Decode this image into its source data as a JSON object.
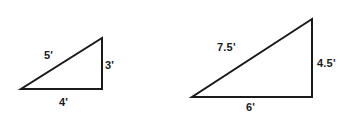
{
  "figure": {
    "background_color": "#ffffff",
    "stroke_color": "#1a1a1a",
    "text_color": "#1a1a1a",
    "stroke_width": 2
  },
  "chart_data": {
    "type": "diagram",
    "shapes": [
      {
        "name": "small-triangle",
        "kind": "right-triangle",
        "vertices": [
          [
            21,
            89
          ],
          [
            102,
            89
          ],
          [
            102,
            38
          ]
        ],
        "sides": [
          {
            "name": "hypotenuse",
            "label": "5'",
            "value": 5,
            "unit": "feet"
          },
          {
            "name": "vertical-leg",
            "label": "3'",
            "value": 3,
            "unit": "feet"
          },
          {
            "name": "base-leg",
            "label": "4'",
            "value": 4,
            "unit": "feet"
          }
        ]
      },
      {
        "name": "large-triangle",
        "kind": "right-triangle",
        "vertices": [
          [
            192,
            97
          ],
          [
            312,
            97
          ],
          [
            312,
            19
          ]
        ],
        "sides": [
          {
            "name": "hypotenuse",
            "label": "7.5'",
            "value": 7.5,
            "unit": "feet"
          },
          {
            "name": "vertical-leg",
            "label": "4.5'",
            "value": 4.5,
            "unit": "feet"
          },
          {
            "name": "base-leg",
            "label": "6'",
            "value": 6,
            "unit": "feet"
          }
        ]
      }
    ]
  },
  "labels": {
    "small": {
      "hypotenuse": "5'",
      "vertical": "3'",
      "base": "4'"
    },
    "large": {
      "hypotenuse": "7.5'",
      "vertical": "4.5'",
      "base": "6'"
    }
  }
}
